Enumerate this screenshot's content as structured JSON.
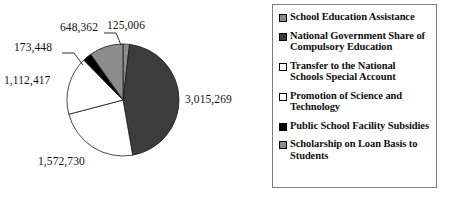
{
  "chart_data": {
    "type": "pie",
    "title": "",
    "subtitle": "",
    "xlabel": "",
    "ylabel": "",
    "legend_position": "right",
    "grid": false,
    "total": 6647232,
    "categories": [
      "School Education Assistance",
      "National Government Share of Compulsory Education",
      "Transfer to the National Schools Special Account",
      "Promotion of Science and Technology",
      "Public School Facility Subsidies",
      "Scholarship on Loan Basis to Students"
    ],
    "values": [
      125006,
      3015269,
      1572730,
      1112417,
      173448,
      648362
    ],
    "value_labels": [
      "125,006",
      "3,015,269",
      "1,572,730",
      "1,112,417",
      "173,448",
      "648,362"
    ],
    "colors": [
      "#8c8c8c",
      "#3c3c3c",
      "#ffffff",
      "#ffffff",
      "#000000",
      "#8c8c8c"
    ],
    "slices": [
      {
        "name": "School Education Assistance",
        "value": 125006,
        "label": "125,006",
        "color": "#8c8c8c"
      },
      {
        "name": "National Government Share of Compulsory Education",
        "value": 3015269,
        "label": "3,015,269",
        "color": "#3c3c3c"
      },
      {
        "name": "Transfer to the National Schools Special Account",
        "value": 1572730,
        "label": "1,572,730",
        "color": "#ffffff"
      },
      {
        "name": "Promotion of Science and Technology",
        "value": 1112417,
        "label": "1,112,417",
        "color": "#ffffff"
      },
      {
        "name": "Public School Facility Subsidies",
        "value": 173448,
        "label": "173,448",
        "color": "#000000"
      },
      {
        "name": "Scholarship on Loan Basis to Students",
        "value": 648362,
        "label": "648,362",
        "color": "#8c8c8c"
      }
    ]
  },
  "labels": {
    "top_right": "125,006",
    "top_left": "648,362",
    "upper_left": "173,448",
    "left": "1,112,417",
    "bottom_left": "1,572,730",
    "right": "3,015,269"
  },
  "legend": {
    "items": [
      {
        "label": "School Education Assistance",
        "swatch": "gray-swatch-icon"
      },
      {
        "label": "National Government Share of Compulsory Education",
        "swatch": "dark-gray-swatch-icon"
      },
      {
        "label": "Transfer to the National Schools Special Account",
        "swatch": "white-swatch-icon"
      },
      {
        "label": "Promotion of Science and Technology",
        "swatch": "white-swatch-icon"
      },
      {
        "label": "Public School Facility Subsidies",
        "swatch": "black-swatch-icon"
      },
      {
        "label": "Scholarship on Loan Basis to Students",
        "swatch": "gray-swatch-icon"
      }
    ]
  }
}
